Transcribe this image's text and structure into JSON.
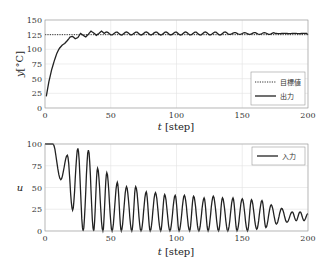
{
  "chart_data": [
    {
      "type": "line",
      "title": "",
      "xlabel": "t [step]",
      "ylabel": "y[°C]",
      "xlim": [
        0,
        200
      ],
      "ylim": [
        0,
        150
      ],
      "xticks": [
        "0",
        "50",
        "100",
        "150",
        "200"
      ],
      "yticks": [
        "0",
        "25",
        "50",
        "75",
        "100",
        "125",
        "150"
      ],
      "grid": true,
      "legend_position": "lower right",
      "series": [
        {
          "name": "目標値",
          "style": "dotted",
          "x": [
            0,
            200
          ],
          "values": [
            125,
            125
          ]
        },
        {
          "name": "出力",
          "style": "solid",
          "x": [
            1,
            3,
            5,
            7,
            9,
            11,
            13,
            15,
            17,
            19,
            21,
            23,
            25,
            27,
            29,
            31,
            33,
            35,
            37,
            39,
            41,
            43,
            45,
            50,
            60,
            70,
            80,
            90,
            100,
            110,
            120,
            130,
            140,
            150,
            160,
            170,
            180,
            190,
            200
          ],
          "values": [
            20,
            45,
            65,
            80,
            93,
            102,
            107,
            110,
            115,
            121,
            122,
            118,
            120,
            127,
            124,
            121,
            126,
            131,
            128,
            124,
            127,
            131,
            127,
            128,
            127,
            128,
            127,
            128,
            127,
            128,
            127,
            127,
            126,
            127,
            126,
            126,
            125,
            125,
            125
          ]
        }
      ]
    },
    {
      "type": "line",
      "title": "",
      "xlabel": "t [step]",
      "ylabel": "u",
      "xlim": [
        0,
        200
      ],
      "ylim": [
        0,
        100
      ],
      "xticks": [
        "0",
        "50",
        "100",
        "150",
        "200"
      ],
      "yticks": [
        "0",
        "25",
        "50",
        "75",
        "100"
      ],
      "grid": true,
      "legend_position": "upper right",
      "series": [
        {
          "name": "入力",
          "style": "solid",
          "peaks": [
            {
              "t": 0,
              "u": 100
            },
            {
              "t": 6,
              "u": 100
            },
            {
              "t": 12,
              "u": 59
            },
            {
              "t": 17,
              "u": 87
            },
            {
              "t": 21,
              "u": 24
            },
            {
              "t": 25,
              "u": 95
            },
            {
              "t": 29,
              "u": 0
            },
            {
              "t": 33,
              "u": 93
            },
            {
              "t": 37,
              "u": 0
            },
            {
              "t": 40,
              "u": 72
            },
            {
              "t": 44,
              "u": 0
            },
            {
              "t": 47,
              "u": 67
            },
            {
              "t": 51,
              "u": 0
            },
            {
              "t": 55,
              "u": 56
            },
            {
              "t": 58,
              "u": 0
            },
            {
              "t": 62,
              "u": 51
            },
            {
              "t": 66,
              "u": 0
            },
            {
              "t": 69,
              "u": 51
            },
            {
              "t": 73,
              "u": 0
            },
            {
              "t": 77,
              "u": 45
            },
            {
              "t": 80,
              "u": 0
            },
            {
              "t": 84,
              "u": 44
            },
            {
              "t": 88,
              "u": 0
            },
            {
              "t": 91,
              "u": 42
            },
            {
              "t": 95,
              "u": 0
            },
            {
              "t": 99,
              "u": 41
            },
            {
              "t": 102,
              "u": 0
            },
            {
              "t": 106,
              "u": 41
            },
            {
              "t": 110,
              "u": 0
            },
            {
              "t": 113,
              "u": 40
            },
            {
              "t": 117,
              "u": 0
            },
            {
              "t": 121,
              "u": 38
            },
            {
              "t": 124,
              "u": 0
            },
            {
              "t": 128,
              "u": 40
            },
            {
              "t": 132,
              "u": 0
            },
            {
              "t": 135,
              "u": 38
            },
            {
              "t": 139,
              "u": 0
            },
            {
              "t": 143,
              "u": 38
            },
            {
              "t": 146,
              "u": 0
            },
            {
              "t": 150,
              "u": 37
            },
            {
              "t": 154,
              "u": 0
            },
            {
              "t": 157,
              "u": 36
            },
            {
              "t": 161,
              "u": 2
            },
            {
              "t": 165,
              "u": 35
            },
            {
              "t": 168,
              "u": 4
            },
            {
              "t": 172,
              "u": 30
            },
            {
              "t": 176,
              "u": 8
            },
            {
              "t": 180,
              "u": 26
            },
            {
              "t": 184,
              "u": 10
            },
            {
              "t": 188,
              "u": 22
            },
            {
              "t": 191,
              "u": 12
            },
            {
              "t": 194,
              "u": 22
            },
            {
              "t": 197,
              "u": 12
            },
            {
              "t": 200,
              "u": 20
            }
          ]
        }
      ]
    }
  ],
  "top": {
    "ylabel_main": "y",
    "ylabel_unit": "[°C]",
    "xlabel_main": "t",
    "xlabel_unit": "[step]",
    "legend": {
      "target": "目標値",
      "output": "出力"
    }
  },
  "bottom": {
    "ylabel": "u",
    "xlabel_main": "t",
    "xlabel_unit": "[step]",
    "legend": {
      "input": "入力"
    }
  }
}
